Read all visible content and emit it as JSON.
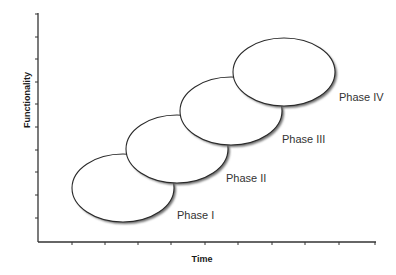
{
  "diagram": {
    "type": "overlapping-phase-ellipses",
    "x_axis": {
      "label": "Time",
      "ticks": 10
    },
    "y_axis": {
      "label": "Functionality",
      "ticks": 10
    },
    "phases": [
      {
        "label": "Phase I",
        "order": 1
      },
      {
        "label": "Phase II",
        "order": 2
      },
      {
        "label": "Phase III",
        "order": 3
      },
      {
        "label": "Phase IV",
        "order": 4
      }
    ],
    "colors": {
      "axis": "#333333",
      "ellipse_stroke": "#2a2a2a",
      "ellipse_fill": "#ffffff",
      "shadow": "#7a7a7a",
      "label": "#333333"
    }
  }
}
